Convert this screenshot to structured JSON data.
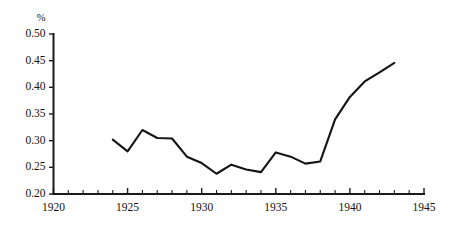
{
  "chart_data": {
    "type": "line",
    "title": "",
    "subtitle": "",
    "xlabel": "",
    "ylabel": "%",
    "ylabel_position": "above-axis-top",
    "xlim": [
      1920,
      1945
    ],
    "ylim": [
      0.2,
      0.5
    ],
    "grid": false,
    "legend": false,
    "legend_position": "none",
    "x_tick_labels": [
      "1920",
      "1925",
      "1930",
      "1935",
      "1940",
      "1945"
    ],
    "x_tick_values": [
      1920,
      1925,
      1930,
      1935,
      1940,
      1945
    ],
    "x_minor_tick_step": 1,
    "y_tick_labels": [
      "0.20",
      "0.25",
      "0.30",
      "0.35",
      "0.40",
      "0.45",
      "0.50"
    ],
    "y_tick_values": [
      0.2,
      0.25,
      0.3,
      0.35,
      0.4,
      0.45,
      0.5
    ],
    "series": [
      {
        "name": "percent-series",
        "x": [
          1924,
          1925,
          1926,
          1927,
          1928,
          1929,
          1930,
          1931,
          1932,
          1933,
          1934,
          1935,
          1936,
          1937,
          1938,
          1939,
          1940,
          1941,
          1942,
          1943
        ],
        "values": [
          0.302,
          0.28,
          0.32,
          0.305,
          0.304,
          0.27,
          0.258,
          0.238,
          0.255,
          0.246,
          0.241,
          0.278,
          0.27,
          0.257,
          0.261,
          0.34,
          0.382,
          0.411,
          0.428,
          0.446
        ],
        "color": "#141414"
      }
    ],
    "annotations": []
  },
  "axes": {
    "y_unit": "%",
    "line_color": "#1a1a1a"
  }
}
